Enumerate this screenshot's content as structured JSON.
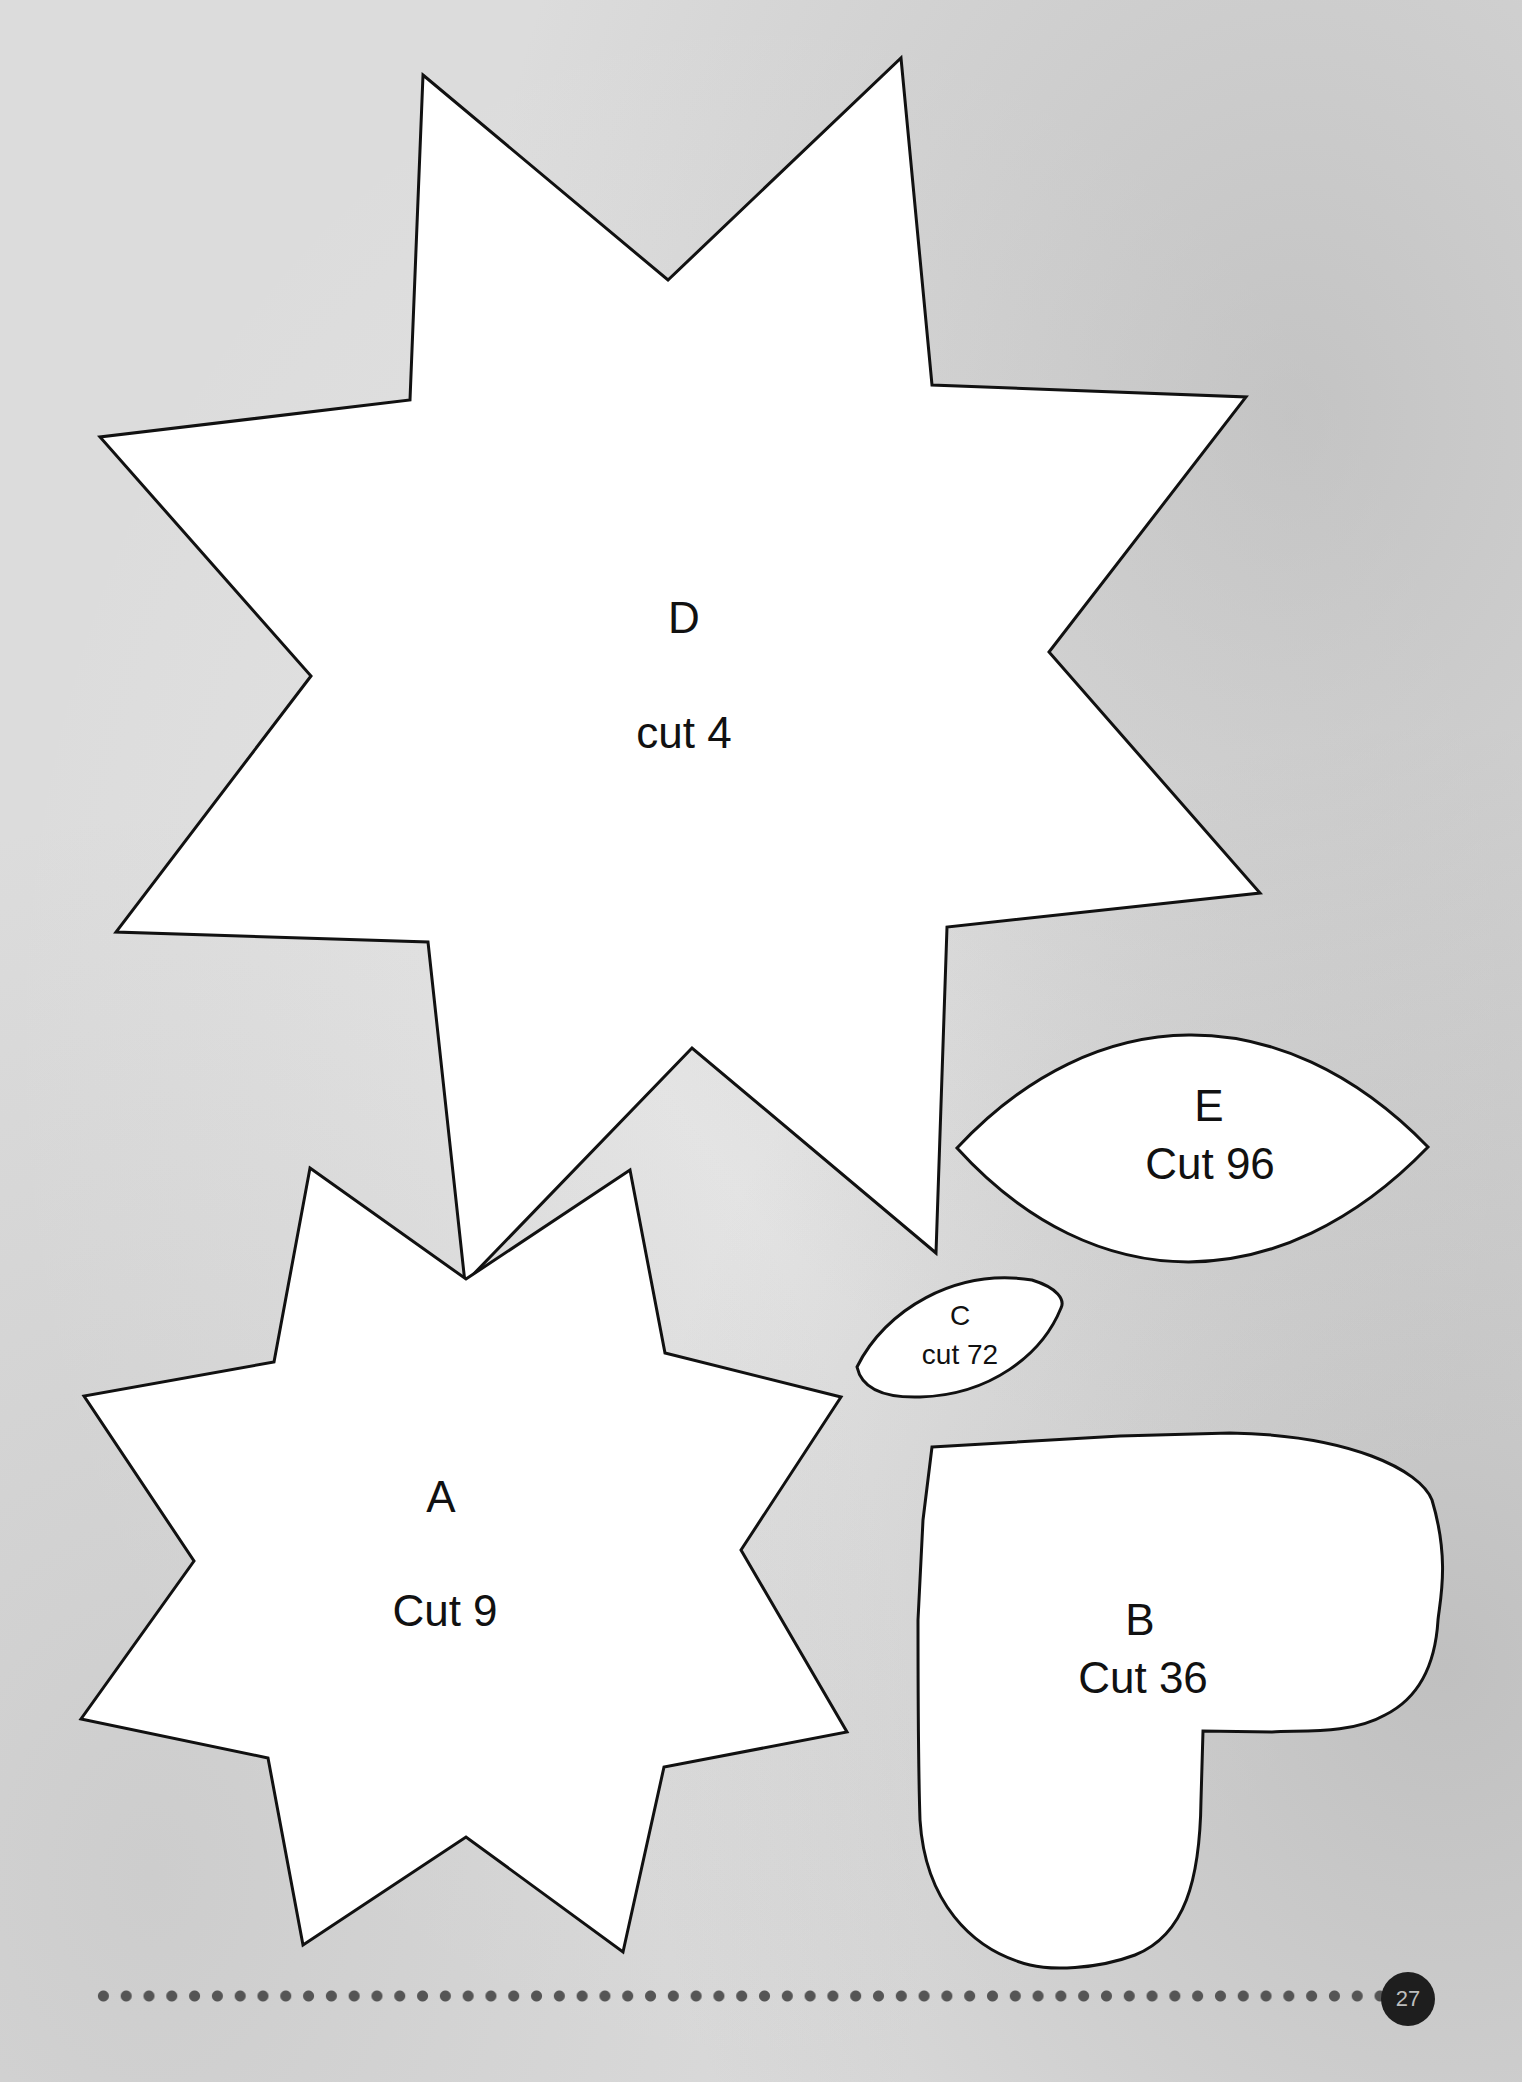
{
  "page": {
    "number": "27",
    "background_color": "#dcdcdc",
    "outline_color": "#111111",
    "fill_color": "#ffffff"
  },
  "pieces": {
    "D": {
      "letter": "D",
      "cut": "cut 4",
      "shape": "7-point star"
    },
    "E": {
      "letter": "E",
      "cut": "Cut 96",
      "shape": "leaf / almond"
    },
    "C": {
      "letter": "C",
      "cut": "cut 72",
      "shape": "small leaf / almond"
    },
    "A": {
      "letter": "A",
      "cut": "Cut 9",
      "shape": "8-point star"
    },
    "B": {
      "letter": "B",
      "cut": "Cut 36",
      "shape": "half heart"
    }
  }
}
